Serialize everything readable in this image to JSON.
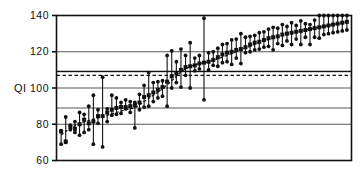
{
  "chart_data": {
    "type": "scatter",
    "title": "",
    "subtitle": "",
    "xlabel": "",
    "ylabel": "QI",
    "ylim": [
      60,
      140
    ],
    "xlim": [
      0,
      64
    ],
    "yticks": [
      60,
      80,
      100,
      120,
      140
    ],
    "ytick_labels": [
      "60",
      "80",
      "100",
      "120",
      "140"
    ],
    "xticks": [],
    "xtick_labels": [],
    "grid": true,
    "gridlines_y": [
      80,
      89,
      100,
      109,
      120
    ],
    "legend": "none",
    "legend_position": "none",
    "annotations": [],
    "reference_lines": [
      {
        "name": "solid-reference-line",
        "y": 109.2,
        "style": "solid",
        "color": "#111111"
      },
      {
        "name": "dashed-reference-line",
        "y": 107.0,
        "style": "dashed",
        "color": "#111111"
      }
    ],
    "series": [
      {
        "name": "QI estimate with range",
        "marker": "square",
        "color": "#111111",
        "points": [
          {
            "x": 1,
            "y": 76.0,
            "low": 69.0,
            "high": 76.5
          },
          {
            "x": 2,
            "y": 70.5,
            "low": 70.0,
            "high": 84.0
          },
          {
            "x": 3,
            "y": 78.5,
            "low": 77.0,
            "high": 79.5
          },
          {
            "x": 4,
            "y": 77.5,
            "low": 75.5,
            "high": 81.5
          },
          {
            "x": 5,
            "y": 80.0,
            "low": 74.0,
            "high": 86.5
          },
          {
            "x": 6,
            "y": 82.5,
            "low": 75.5,
            "high": 85.5
          },
          {
            "x": 7,
            "y": 80.5,
            "low": 77.0,
            "high": 90.0
          },
          {
            "x": 8,
            "y": 81.5,
            "low": 69.0,
            "high": 96.0
          },
          {
            "x": 9,
            "y": 84.5,
            "low": 80.5,
            "high": 88.0
          },
          {
            "x": 10,
            "y": 84.5,
            "low": 67.5,
            "high": 106.0
          },
          {
            "x": 11,
            "y": 86.5,
            "low": 81.5,
            "high": 88.5
          },
          {
            "x": 12,
            "y": 88.0,
            "low": 85.0,
            "high": 96.0
          },
          {
            "x": 13,
            "y": 89.0,
            "low": 85.5,
            "high": 94.5
          },
          {
            "x": 14,
            "y": 89.5,
            "low": 86.0,
            "high": 92.0
          },
          {
            "x": 15,
            "y": 89.5,
            "low": 88.5,
            "high": 93.5
          },
          {
            "x": 16,
            "y": 90.0,
            "low": 86.5,
            "high": 92.5
          },
          {
            "x": 17,
            "y": 90.5,
            "low": 78.0,
            "high": 92.0
          },
          {
            "x": 18,
            "y": 92.0,
            "low": 88.0,
            "high": 96.5
          },
          {
            "x": 19,
            "y": 95.0,
            "low": 89.5,
            "high": 101.5
          },
          {
            "x": 20,
            "y": 96.0,
            "low": 90.0,
            "high": 108.5
          },
          {
            "x": 21,
            "y": 97.5,
            "low": 92.5,
            "high": 103.0
          },
          {
            "x": 22,
            "y": 99.0,
            "low": 94.5,
            "high": 103.5
          },
          {
            "x": 23,
            "y": 100.5,
            "low": 95.5,
            "high": 104.0
          },
          {
            "x": 24,
            "y": 103.5,
            "low": 90.0,
            "high": 118.0
          },
          {
            "x": 25,
            "y": 106.5,
            "low": 100.0,
            "high": 120.5
          },
          {
            "x": 26,
            "y": 108.0,
            "low": 103.0,
            "high": 114.5
          },
          {
            "x": 27,
            "y": 110.0,
            "low": 100.5,
            "high": 121.5
          },
          {
            "x": 28,
            "y": 111.5,
            "low": 107.0,
            "high": 118.0
          },
          {
            "x": 29,
            "y": 112.0,
            "low": 100.0,
            "high": 125.0
          },
          {
            "x": 30,
            "y": 112.5,
            "low": 109.5,
            "high": 116.5
          },
          {
            "x": 31,
            "y": 113.5,
            "low": 110.5,
            "high": 118.0
          },
          {
            "x": 32,
            "y": 114.0,
            "low": 93.5,
            "high": 138.5
          },
          {
            "x": 33,
            "y": 114.5,
            "low": 110.0,
            "high": 119.5
          },
          {
            "x": 34,
            "y": 115.5,
            "low": 112.5,
            "high": 120.0
          },
          {
            "x": 35,
            "y": 117.0,
            "low": 112.0,
            "high": 122.0
          },
          {
            "x": 36,
            "y": 118.5,
            "low": 114.0,
            "high": 124.0
          },
          {
            "x": 37,
            "y": 119.5,
            "low": 114.5,
            "high": 124.5
          },
          {
            "x": 38,
            "y": 120.0,
            "low": 113.0,
            "high": 126.5
          },
          {
            "x": 39,
            "y": 121.0,
            "low": 116.5,
            "high": 127.0
          },
          {
            "x": 40,
            "y": 121.5,
            "low": 113.5,
            "high": 130.0
          },
          {
            "x": 41,
            "y": 122.5,
            "low": 119.5,
            "high": 128.0
          },
          {
            "x": 42,
            "y": 124.0,
            "low": 120.0,
            "high": 128.5
          },
          {
            "x": 43,
            "y": 125.0,
            "low": 121.0,
            "high": 129.0
          },
          {
            "x": 44,
            "y": 125.5,
            "low": 121.5,
            "high": 130.5
          },
          {
            "x": 45,
            "y": 126.5,
            "low": 122.5,
            "high": 131.0
          },
          {
            "x": 46,
            "y": 127.5,
            "low": 123.0,
            "high": 132.5
          },
          {
            "x": 47,
            "y": 128.0,
            "low": 121.0,
            "high": 133.5
          },
          {
            "x": 48,
            "y": 128.5,
            "low": 124.5,
            "high": 133.0
          },
          {
            "x": 49,
            "y": 129.5,
            "low": 123.5,
            "high": 135.0
          },
          {
            "x": 50,
            "y": 130.0,
            "low": 126.0,
            "high": 134.0
          },
          {
            "x": 51,
            "y": 130.5,
            "low": 124.0,
            "high": 136.0
          },
          {
            "x": 52,
            "y": 131.0,
            "low": 127.0,
            "high": 134.5
          },
          {
            "x": 53,
            "y": 131.5,
            "low": 124.0,
            "high": 137.0
          },
          {
            "x": 54,
            "y": 132.0,
            "low": 128.0,
            "high": 135.5
          },
          {
            "x": 55,
            "y": 132.5,
            "low": 124.0,
            "high": 135.0
          },
          {
            "x": 56,
            "y": 133.0,
            "low": 128.0,
            "high": 137.5
          },
          {
            "x": 57,
            "y": 133.5,
            "low": 127.5,
            "high": 140.0
          },
          {
            "x": 58,
            "y": 134.0,
            "low": 129.5,
            "high": 140.0
          },
          {
            "x": 59,
            "y": 134.5,
            "low": 130.0,
            "high": 140.0
          },
          {
            "x": 60,
            "y": 135.0,
            "low": 130.5,
            "high": 140.0
          },
          {
            "x": 61,
            "y": 135.5,
            "low": 131.0,
            "high": 140.0
          },
          {
            "x": 62,
            "y": 136.0,
            "low": 131.5,
            "high": 140.0
          },
          {
            "x": 63,
            "y": 136.5,
            "low": 132.0,
            "high": 140.0
          }
        ]
      }
    ],
    "trend_line": {
      "name": "fitted-trend-line",
      "style": "dashed",
      "color": "#111111",
      "points": [
        {
          "x": 1,
          "y": 74.0
        },
        {
          "x": 3,
          "y": 78.0
        },
        {
          "x": 5,
          "y": 80.5
        },
        {
          "x": 7,
          "y": 82.0
        },
        {
          "x": 9,
          "y": 83.5
        },
        {
          "x": 11,
          "y": 85.0
        },
        {
          "x": 13,
          "y": 86.5
        },
        {
          "x": 15,
          "y": 88.0
        },
        {
          "x": 17,
          "y": 89.0
        },
        {
          "x": 19,
          "y": 92.5
        },
        {
          "x": 21,
          "y": 96.0
        },
        {
          "x": 23,
          "y": 99.5
        },
        {
          "x": 25,
          "y": 104.0
        },
        {
          "x": 27,
          "y": 109.0
        },
        {
          "x": 29,
          "y": 112.0
        },
        {
          "x": 31,
          "y": 113.5
        },
        {
          "x": 33,
          "y": 114.5
        },
        {
          "x": 35,
          "y": 116.0
        },
        {
          "x": 37,
          "y": 118.0
        },
        {
          "x": 39,
          "y": 120.0
        },
        {
          "x": 41,
          "y": 122.0
        },
        {
          "x": 43,
          "y": 124.0
        },
        {
          "x": 45,
          "y": 126.0
        },
        {
          "x": 47,
          "y": 127.5
        },
        {
          "x": 49,
          "y": 129.0
        },
        {
          "x": 51,
          "y": 130.5
        },
        {
          "x": 53,
          "y": 131.5
        },
        {
          "x": 55,
          "y": 132.5
        },
        {
          "x": 57,
          "y": 133.5
        },
        {
          "x": 59,
          "y": 134.5
        },
        {
          "x": 61,
          "y": 135.5
        },
        {
          "x": 63,
          "y": 136.5
        }
      ]
    },
    "colors": {
      "marker": "#111111",
      "line": "#111111",
      "grid": "#555555",
      "axis": "#111111",
      "background": "#ffffff"
    }
  }
}
